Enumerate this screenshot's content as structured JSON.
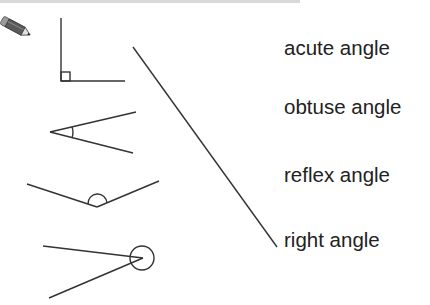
{
  "worksheet": {
    "icon": "pencil-icon",
    "task": "match each angle to its name",
    "colors": {
      "stroke": "#333333",
      "text": "#222222",
      "strip": "#d9d9d9"
    },
    "figures": [
      {
        "id": "figure-right-angle",
        "marker": "square"
      },
      {
        "id": "figure-acute-angle",
        "marker": "arc"
      },
      {
        "id": "figure-obtuse-angle",
        "marker": "semicircle"
      },
      {
        "id": "figure-reflex-angle",
        "marker": "circle"
      }
    ],
    "labels": [
      {
        "text": "acute angle",
        "top": 38
      },
      {
        "text": "obtuse angle",
        "top": 97
      },
      {
        "text": "reflex angle",
        "top": 165
      },
      {
        "text": "right angle",
        "top": 230
      }
    ],
    "matching_line": {
      "from_figure": "right angle",
      "to_label": "right angle"
    }
  }
}
